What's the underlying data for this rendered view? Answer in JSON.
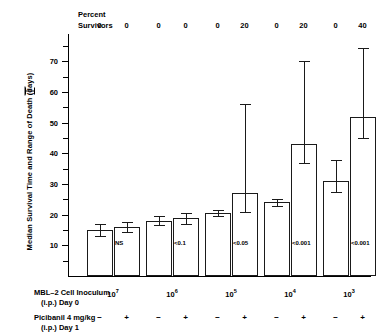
{
  "chart_data": {
    "type": "bar",
    "title": "",
    "xlabel": "MBL-2 Cell Inoculum (i.p.) Day 0",
    "ylabel": "Median Survival Time and Range of Death  (days)",
    "ylim": [
      0,
      75
    ],
    "yticks": [
      10,
      20,
      30,
      40,
      50,
      60,
      70
    ],
    "grid": false,
    "legend": "none",
    "categories": [
      "10⁷",
      "10⁶",
      "10⁵",
      "10⁴",
      "10³"
    ],
    "series": [
      {
        "name": "Picibanil −",
        "values": [
          15,
          18,
          20.5,
          24,
          31
        ],
        "err_low": [
          13,
          16.5,
          19.5,
          23,
          27.5
        ],
        "err_high": [
          17,
          19.5,
          21.5,
          25,
          38
        ]
      },
      {
        "name": "Picibanil +",
        "values": [
          16,
          19,
          27,
          43,
          52
        ],
        "err_low": [
          14.5,
          17,
          21,
          37,
          45
        ],
        "err_high": [
          17.5,
          20.5,
          56,
          70,
          74.5
        ]
      }
    ],
    "pvalues": [
      "NS",
      "<0.1",
      "<0.05",
      "<0.001",
      "<0.001"
    ],
    "percent_survivors": [
      {
        "minus": "0",
        "plus": "0"
      },
      {
        "minus": "0",
        "plus": "0"
      },
      {
        "minus": "0",
        "plus": "20"
      },
      {
        "minus": "0",
        "plus": "20"
      },
      {
        "minus": "0",
        "plus": "40"
      }
    ]
  },
  "header": {
    "percent_line1": "Percent",
    "percent_line2": "Survivors"
  },
  "axis": {
    "y_title_part1": "Median Survival Time and Range of Death",
    "y_title_part2": "(days)",
    "ytick_labels": [
      "70",
      "60",
      "50",
      "40",
      "30",
      "20",
      "10"
    ]
  },
  "rows": {
    "inoculum_line1": "MBL–2 Cell Inoculum",
    "inoculum_line2": "(i.p.) Day 0",
    "picibanil_line1": "Picibanil 4 mg/kg",
    "picibanil_line2": "(i.p.) Day 1",
    "minus": "−",
    "plus": "+"
  },
  "group_labels": [
    {
      "base": "10",
      "exp": "7"
    },
    {
      "base": "10",
      "exp": "6"
    },
    {
      "base": "10",
      "exp": "5"
    },
    {
      "base": "10",
      "exp": "4"
    },
    {
      "base": "10",
      "exp": "3"
    }
  ]
}
